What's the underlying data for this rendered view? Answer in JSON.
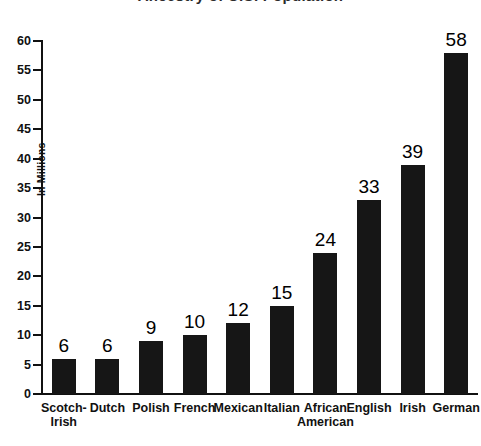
{
  "chart_data": {
    "type": "bar",
    "title": "Ancestry of U.S. Population",
    "xlabel": "",
    "ylabel": "In Millions",
    "ylim": [
      0,
      60
    ],
    "ytick_step": 5,
    "yticks": [
      60,
      55,
      50,
      45,
      40,
      35,
      30,
      25,
      20,
      15,
      10,
      5,
      0
    ],
    "grid": false,
    "legend": "none",
    "bar_color": "#161616",
    "categories": [
      "Scotch-Irish",
      "Dutch",
      "Polish",
      "French",
      "Mexican",
      "Italian",
      "African American",
      "English",
      "Irish",
      "German"
    ],
    "category_lines": [
      [
        "Scotch-",
        "Irish"
      ],
      [
        "Dutch",
        ""
      ],
      [
        "Polish",
        ""
      ],
      [
        "French",
        ""
      ],
      [
        "Mexican",
        ""
      ],
      [
        "Italian",
        ""
      ],
      [
        "African",
        "American"
      ],
      [
        "English",
        ""
      ],
      [
        "Irish",
        ""
      ],
      [
        "German",
        ""
      ]
    ],
    "values": [
      6,
      6,
      9,
      10,
      12,
      15,
      24,
      33,
      39,
      58
    ],
    "value_labels": [
      "6",
      "6",
      "9",
      "10",
      "12",
      "15",
      "24",
      "33",
      "39",
      "58"
    ]
  }
}
